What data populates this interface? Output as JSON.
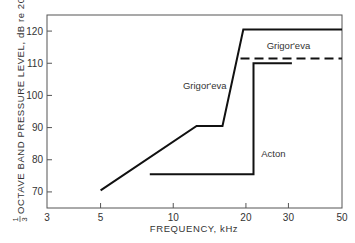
{
  "chart_data": {
    "type": "line",
    "title": "",
    "xlabel": "FREQUENCY, kHz",
    "ylabel": "1/3 OCTAVE BAND PRESSURE LEVEL, dB re 20 µPa",
    "ylabel_fraction": {
      "num": "1",
      "den": "3"
    },
    "ylabel_rest": "OCTAVE BAND PRESSURE LEVEL, dB re 20 µPa",
    "xscale": "log",
    "xlim": [
      3,
      50
    ],
    "ylim": [
      65,
      125
    ],
    "xticks": [
      3,
      5,
      10,
      20,
      30,
      50
    ],
    "xtick_labels": [
      "3",
      "5",
      "10",
      "20",
      "30",
      "50"
    ],
    "yticks": [
      70,
      80,
      90,
      100,
      110,
      120
    ],
    "ytick_labels": [
      "70",
      "80",
      "90",
      "100",
      "110",
      "120"
    ],
    "grid": false,
    "legend": "none (inline annotations)",
    "series": [
      {
        "name": "Grigor'eva",
        "style": "solid",
        "x": [
          5,
          12.5,
          16,
          19.5,
          50
        ],
        "y": [
          70.5,
          90.5,
          90.5,
          120.5,
          120.5
        ]
      },
      {
        "name": "Grigor'eva",
        "style": "dashed",
        "x": [
          19,
          50
        ],
        "y": [
          111.5,
          111.5
        ]
      },
      {
        "name": "Acton",
        "style": "solid",
        "x": [
          8,
          21.5,
          21.5,
          31
        ],
        "y": [
          75.5,
          75.5,
          110,
          110
        ]
      }
    ],
    "annotations": [
      {
        "text": "Grigor'eva",
        "x": 13.5,
        "y": 102,
        "refers_to": "solid Grigor'eva curve"
      },
      {
        "text": "Grigor'eva",
        "x": 30,
        "y": 114.5,
        "refers_to": "dashed Grigor'eva line"
      },
      {
        "text": "Acton",
        "x": 26,
        "y": 81,
        "refers_to": "Acton curve"
      }
    ]
  }
}
